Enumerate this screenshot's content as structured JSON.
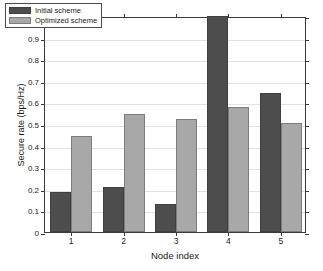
{
  "chart_data": {
    "type": "bar",
    "title": "",
    "subtitle": "",
    "xlabel": "Node index",
    "ylabel": "Secure rate (bps/Hz)",
    "categories": [
      "1",
      "2",
      "3",
      "4",
      "5"
    ],
    "series": [
      {
        "name": "Initial scheme",
        "color": "#4d4d4d",
        "values": [
          0.185,
          0.21,
          0.13,
          1.0,
          0.645
        ]
      },
      {
        "name": "Optimized scheme",
        "color": "#a8a8a8",
        "values": [
          0.445,
          0.548,
          0.522,
          0.58,
          0.507
        ]
      }
    ],
    "ylim": [
      0,
      1
    ],
    "xlim": [
      0.5,
      5.5
    ],
    "ytick_labels": [
      "0",
      "0.1",
      "0.2",
      "0.3",
      "0.4",
      "0.5",
      "0.6",
      "0.7",
      "0.8",
      "0.9",
      "1"
    ],
    "ytick_values": [
      0,
      0.1,
      0.2,
      0.3,
      0.4,
      0.5,
      0.6,
      0.7,
      0.8,
      0.9,
      1
    ],
    "xtick_labels": [
      "1",
      "2",
      "3",
      "4",
      "5"
    ],
    "grid": true,
    "grid_axis": "y",
    "legend_position": "top-left",
    "legend": [
      "Initial scheme",
      "Optimized scheme"
    ]
  },
  "legend": {
    "items": [
      {
        "label": "Initial scheme",
        "swatch": "legend-swatch-initial"
      },
      {
        "label": "Optimized scheme",
        "swatch": "legend-swatch-optimized"
      }
    ]
  },
  "colors": {
    "initial": "#4d4d4d",
    "optimized": "#a8a8a8",
    "axis": "#3a3a3a",
    "grid": "#e2e2e2",
    "background": "#ffffff"
  }
}
